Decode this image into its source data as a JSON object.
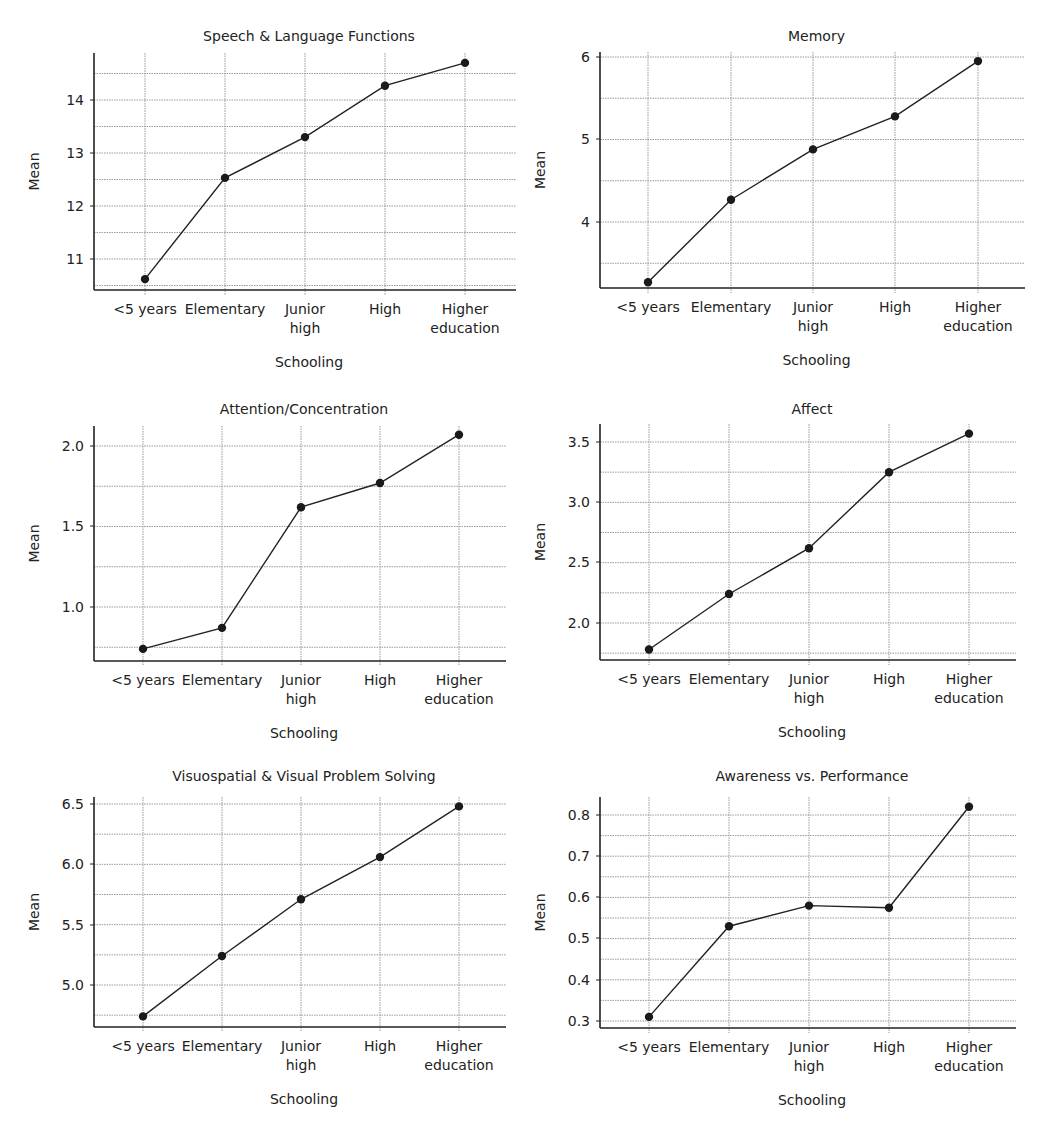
{
  "chart_data": [
    {
      "type": "line",
      "title": "Speech & Language Functions",
      "xlabel": "Schooling",
      "ylabel": "Mean",
      "categories": [
        "<5 years",
        "Elementary",
        "Junior high",
        "High",
        "Higher education"
      ],
      "values": [
        10.62,
        12.53,
        13.3,
        14.27,
        14.7
      ],
      "yticks": [
        11,
        12,
        13,
        14
      ],
      "ytick_labels": [
        "11",
        "12",
        "13",
        "14"
      ],
      "ylim": [
        10.45,
        14.85
      ],
      "minor_grid_step": 0.5,
      "grid": true,
      "legend": null
    },
    {
      "type": "line",
      "title": "Memory",
      "xlabel": "Schooling",
      "ylabel": "Mean",
      "categories": [
        "<5 years",
        "Elementary",
        "Junior high",
        "High",
        "Higher education"
      ],
      "values": [
        3.27,
        4.27,
        4.88,
        5.28,
        5.95
      ],
      "yticks": [
        4,
        5,
        6
      ],
      "ytick_labels": [
        "4",
        "5",
        "6"
      ],
      "ylim": [
        3.18,
        6.05
      ],
      "minor_grid_step": 0.5,
      "grid": true,
      "legend": null
    },
    {
      "type": "line",
      "title": "Attention/Concentration",
      "xlabel": "Schooling",
      "ylabel": "Mean",
      "categories": [
        "<5 years",
        "Elementary",
        "Junior high",
        "High",
        "Higher education"
      ],
      "values": [
        0.74,
        0.87,
        1.62,
        1.77,
        2.07
      ],
      "yticks": [
        1.0,
        1.5,
        2.0
      ],
      "ytick_labels": [
        "1.0",
        "1.5",
        "2.0"
      ],
      "ylim": [
        0.68,
        2.13
      ],
      "minor_grid_step": 0.25,
      "grid": true,
      "legend": null
    },
    {
      "type": "line",
      "title": "Affect",
      "xlabel": "Schooling",
      "ylabel": "Mean",
      "categories": [
        "<5 years",
        "Elementary",
        "Junior high",
        "High",
        "Higher education"
      ],
      "values": [
        1.78,
        2.24,
        2.62,
        3.25,
        3.57
      ],
      "yticks": [
        2.0,
        2.5,
        3.0,
        3.5
      ],
      "ytick_labels": [
        "2.0",
        "2.5",
        "3.0",
        "3.5"
      ],
      "ylim": [
        1.69,
        3.64
      ],
      "minor_grid_step": 0.25,
      "grid": true,
      "legend": null
    },
    {
      "type": "line",
      "title": "Visuospatial & Visual Problem Solving",
      "xlabel": "Schooling",
      "ylabel": "Mean",
      "categories": [
        "<5 years",
        "Elementary",
        "Junior high",
        "High",
        "Higher education"
      ],
      "values": [
        4.74,
        5.24,
        5.71,
        6.06,
        6.48
      ],
      "yticks": [
        5.0,
        5.5,
        6.0,
        6.5
      ],
      "ytick_labels": [
        "5.0",
        "5.5",
        "6.0",
        "6.5"
      ],
      "ylim": [
        4.65,
        6.55
      ],
      "minor_grid_step": 0.25,
      "grid": true,
      "legend": null
    },
    {
      "type": "line",
      "title": "Awareness vs. Performance",
      "xlabel": "Schooling",
      "ylabel": "Mean",
      "categories": [
        "<5 years",
        "Elementary",
        "Junior high",
        "High",
        "Higher education"
      ],
      "values": [
        0.31,
        0.53,
        0.58,
        0.575,
        0.82
      ],
      "yticks": [
        0.3,
        0.4,
        0.5,
        0.6,
        0.7,
        0.8
      ],
      "ytick_labels": [
        "0.3",
        "0.4",
        "0.5",
        "0.6",
        "0.7",
        "0.8"
      ],
      "ylim": [
        0.285,
        0.845
      ],
      "minor_grid_step": 0.05,
      "grid": true,
      "legend": null
    }
  ],
  "layout": {
    "panels": [
      {
        "axis_left": 94,
        "axis_right": 516,
        "plot_top": 53,
        "axis_bottom": 290,
        "x_positions": [
          145,
          225,
          305,
          385,
          465
        ],
        "title_y": 41,
        "ytick_px": [
          259,
          206,
          153,
          100
        ]
      },
      {
        "axis_left": 600,
        "axis_right": 1025,
        "plot_top": 52,
        "axis_bottom": 288,
        "x_positions": [
          648,
          731,
          813,
          895,
          978
        ],
        "title_y": 41,
        "ytick_px": [
          222,
          139,
          57
        ]
      },
      {
        "axis_left": 94,
        "axis_right": 506,
        "plot_top": 426,
        "axis_bottom": 661,
        "x_positions": [
          143,
          222,
          301,
          380,
          459
        ],
        "title_y": 414,
        "ytick_px": [
          607,
          526,
          446
        ]
      },
      {
        "axis_left": 600,
        "axis_right": 1016,
        "plot_top": 424,
        "axis_bottom": 660,
        "x_positions": [
          649,
          729,
          809,
          889,
          969
        ],
        "title_y": 414,
        "ytick_px": [
          623,
          562,
          502,
          442
        ]
      },
      {
        "axis_left": 94,
        "axis_right": 506,
        "plot_top": 797,
        "axis_bottom": 1027,
        "x_positions": [
          143,
          222,
          301,
          380,
          459
        ],
        "title_y": 781,
        "ytick_px": [
          985,
          925,
          864,
          804
        ]
      },
      {
        "axis_left": 600,
        "axis_right": 1016,
        "plot_top": 797,
        "axis_bottom": 1028,
        "x_positions": [
          649,
          729,
          809,
          889,
          969
        ],
        "title_y": 781,
        "ytick_px": [
          1021,
          980,
          938,
          897,
          856,
          815
        ]
      }
    ],
    "colors": {
      "line": "#222222",
      "marker": "#1a1a1a",
      "grid": "#9a9a9a",
      "axis": "#222222",
      "text": "#222222"
    }
  }
}
